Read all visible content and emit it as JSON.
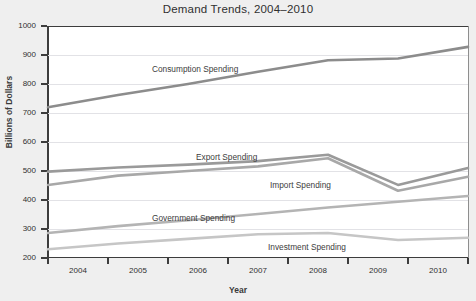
{
  "chart_data": {
    "type": "line",
    "title": "Demand Trends, 2004–2010",
    "xlabel": "Year",
    "ylabel": "Billions of Dollars",
    "x": [
      2004,
      2005,
      2006,
      2007,
      2008,
      2009,
      2010
    ],
    "categories": [
      "2004",
      "2005",
      "2006",
      "2007",
      "2008",
      "2009",
      "2010"
    ],
    "xlim": [
      2004,
      2010
    ],
    "ylim": [
      200,
      1000
    ],
    "yticks": [
      200,
      300,
      400,
      500,
      600,
      700,
      800,
      900,
      1000
    ],
    "ytick_labels": [
      "200",
      "300",
      "400",
      "500",
      "600",
      "700",
      "800",
      "900",
      "1000"
    ],
    "grid": true,
    "legend": "inline-labels",
    "series": [
      {
        "name": "Consumption Spending",
        "color": "#8c8c8c",
        "values": [
          720,
          762,
          800,
          842,
          882,
          888,
          928
        ]
      },
      {
        "name": "Export Spending",
        "color": "#9a9a9a",
        "values": [
          498,
          512,
          522,
          534,
          556,
          452,
          510
        ]
      },
      {
        "name": "Import Spending",
        "color": "#a8a8a8",
        "values": [
          452,
          484,
          500,
          516,
          544,
          432,
          480
        ]
      },
      {
        "name": "Government Spending",
        "color": "#b4b4b4",
        "values": [
          286,
          310,
          330,
          352,
          374,
          394,
          414
        ]
      },
      {
        "name": "Investment Spending",
        "color": "#c6c6c6",
        "values": [
          230,
          250,
          266,
          282,
          286,
          262,
          270
        ]
      }
    ],
    "series_label_positions": [
      {
        "name": "Consumption Spending",
        "left": 152,
        "top": 64
      },
      {
        "name": "Export Spending",
        "left": 196,
        "top": 152
      },
      {
        "name": "Import Spending",
        "left": 270,
        "top": 180
      },
      {
        "name": "Government Spending",
        "left": 152,
        "top": 213
      },
      {
        "name": "Investment Spending",
        "left": 268,
        "top": 242
      }
    ]
  }
}
